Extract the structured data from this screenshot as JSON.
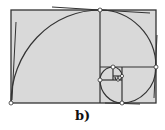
{
  "figure": {
    "label": "b)",
    "colors": {
      "fill": "#d9d9d9",
      "stroke": "#333333",
      "point_fill": "#ffffff"
    }
  }
}
